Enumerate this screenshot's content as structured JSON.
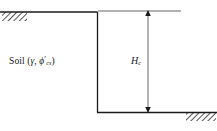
{
  "figure": {
    "type": "geotechnical-cross-section",
    "background_color": "#ffffff",
    "line_color": "#1a1a1a",
    "hatch_color": "#2b2b2b"
  },
  "labels": {
    "soil_prefix": "Soil (",
    "unit_weight_symbol": "γ",
    "separator": ", ",
    "friction_symbol": "ϕ",
    "friction_prime": "′",
    "friction_subscript": "cs",
    "soil_suffix": ")",
    "height_symbol": "H",
    "height_subscript": "c"
  },
  "geometry": {
    "top_ground_line": {
      "x1": 0,
      "y1": 12,
      "x2": 97,
      "y2": 12
    },
    "excavation_face": {
      "x1": 97,
      "y1": 12,
      "x2": 97,
      "y2": 112
    },
    "bottom_ground_line": {
      "x1": 97,
      "y1": 112,
      "x2": 217,
      "y2": 112
    },
    "top_reference_line": {
      "x1": 98,
      "y1": 11,
      "x2": 181,
      "y2": 11
    },
    "dimension_line": {
      "x": 148,
      "y_top": 11,
      "y_bottom": 112
    },
    "hatch_top_left": {
      "x": 2,
      "y": 12,
      "width": 25,
      "height": 9
    },
    "hatch_bottom_right": {
      "x": 186,
      "y": 112,
      "width": 30,
      "height": 9
    }
  }
}
